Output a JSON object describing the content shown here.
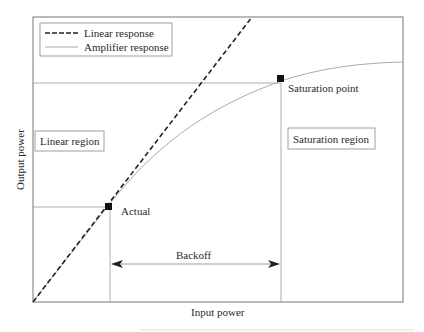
{
  "diagram": {
    "title": "",
    "xlabel": "Input power",
    "ylabel": "Output power",
    "legend": [
      {
        "label": "Linear response",
        "style": "dashed",
        "color": "#222222"
      },
      {
        "label": "Amplifier response",
        "style": "solid",
        "color": "#aaaaaa"
      }
    ],
    "regions": {
      "linear": "Linear region",
      "saturation": "Saturation region"
    },
    "points": {
      "actual": "Actual",
      "saturation": "Saturation point"
    },
    "backoff_label": "Backoff",
    "colors": {
      "axis": "#666666",
      "guide": "#999999",
      "linear": "#222222",
      "amplifier": "#aaaaaa",
      "marker": "#111111"
    }
  }
}
